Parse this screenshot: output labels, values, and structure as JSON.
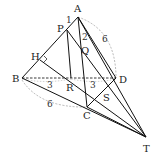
{
  "diagram": {
    "points": {
      "A": {
        "label": "A",
        "x": 78,
        "y": 17
      },
      "P": {
        "label": "P",
        "x": 67,
        "y": 30
      },
      "Q": {
        "label": "Q",
        "x": 81,
        "y": 48
      },
      "H": {
        "label": "H",
        "x": 40,
        "y": 60
      },
      "B": {
        "label": "B",
        "x": 22,
        "y": 78
      },
      "R": {
        "label": "R",
        "x": 71,
        "y": 78
      },
      "D": {
        "label": "D",
        "x": 116,
        "y": 78
      },
      "S": {
        "label": "S",
        "x": 100,
        "y": 93
      },
      "C": {
        "label": "C",
        "x": 87,
        "y": 107
      },
      "T": {
        "label": "T",
        "x": 146,
        "y": 137
      }
    },
    "measures": {
      "AP": "1",
      "PQ": "2",
      "AD": "6",
      "BR": "3",
      "RD": "3",
      "BC": "6"
    }
  }
}
